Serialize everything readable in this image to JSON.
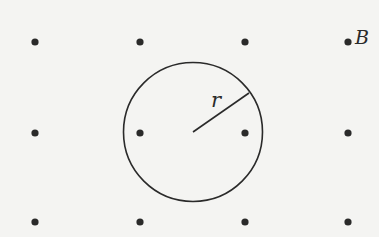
{
  "diagram": {
    "background_color": "#f4f4f2",
    "ink_color": "#2a2a2a",
    "field_dots": {
      "symbol": "out-of-page",
      "columns_x": [
        35,
        140,
        245,
        348
      ],
      "rows_y": [
        42,
        133,
        222
      ],
      "radius": 3.6
    },
    "circle": {
      "cx": 193,
      "cy": 132,
      "r": 69.5
    },
    "radius_line": {
      "x1": 193,
      "y1": 132,
      "x2": 249,
      "y2": 93
    },
    "labels": {
      "field": "B",
      "radius": "r"
    }
  }
}
